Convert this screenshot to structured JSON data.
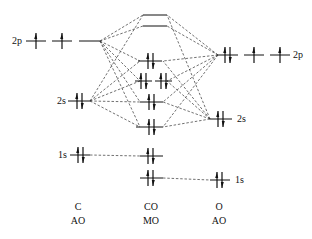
{
  "diagram": {
    "type": "molecular-orbital-diagram",
    "molecule": "CO",
    "left_atom": {
      "name": "C",
      "caption": "AO",
      "orbitals": [
        {
          "label": "2p",
          "electrons": "↑ ↑ _"
        },
        {
          "label": "2s",
          "electrons": "↑↓"
        },
        {
          "label": "1s",
          "electrons": "↑↓"
        }
      ]
    },
    "center": {
      "name": "CO",
      "caption": "MO",
      "levels": [
        {
          "id": "sigma-star-2p",
          "electrons": 0
        },
        {
          "id": "pi-star-2p",
          "electrons": 0
        },
        {
          "id": "sigma-2p",
          "electrons": 2
        },
        {
          "id": "pi-2p-a",
          "electrons": 2
        },
        {
          "id": "pi-2p-b",
          "electrons": 2
        },
        {
          "id": "sigma-star-2s",
          "electrons": 2
        },
        {
          "id": "sigma-2s",
          "electrons": 2
        },
        {
          "id": "sigma-star-1s",
          "electrons": 2
        },
        {
          "id": "sigma-1s",
          "electrons": 2
        }
      ]
    },
    "right_atom": {
      "name": "O",
      "caption": "AO",
      "orbitals": [
        {
          "label": "2p",
          "electrons": "↑↓ ↑ ↑"
        },
        {
          "label": "2s",
          "electrons": "↑↓"
        },
        {
          "label": "1s",
          "electrons": "↑↓"
        }
      ]
    }
  },
  "labels": {
    "c_2p": "2p",
    "c_2s": "2s",
    "c_1s": "1s",
    "o_2p": "2p",
    "o_2s": "2s",
    "o_1s": "1s",
    "c_name": "C",
    "c_caption": "AO",
    "co_name": "CO",
    "co_caption": "MO",
    "o_name": "O",
    "o_caption": "AO"
  }
}
